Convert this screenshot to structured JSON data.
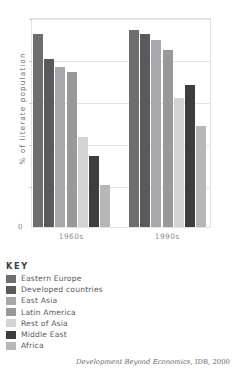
{
  "chart_data": {
    "type": "bar",
    "title": "",
    "xlabel": "",
    "ylabel": "% of literate population",
    "ylim": [
      0,
      100
    ],
    "yticks": [
      0,
      20,
      40,
      60,
      80,
      100
    ],
    "ytick_labels": [
      "0",
      "20",
      "40",
      "60",
      "80",
      "100"
    ],
    "grid": true,
    "legend_position": "below-left",
    "legend_title": "KEY",
    "categories": [
      "1960s",
      "1990s"
    ],
    "series": [
      {
        "name": "Eastern Europe",
        "color": "#6e6e70",
        "values": [
          92,
          94
        ]
      },
      {
        "name": "Developed countries",
        "color": "#5a5a5c",
        "values": [
          80,
          92
        ]
      },
      {
        "name": "East Asia",
        "color": "#a8a8aa",
        "values": [
          76,
          89
        ]
      },
      {
        "name": "Latin America",
        "color": "#999999",
        "values": [
          74,
          84.5
        ]
      },
      {
        "name": "Rest of Asia",
        "color": "#d4d4d4",
        "values": [
          43,
          61.5
        ]
      },
      {
        "name": "Middle East",
        "color": "#3d3d3f",
        "values": [
          34,
          67.5
        ]
      },
      {
        "name": "Africa",
        "color": "#b7b7b9",
        "values": [
          20,
          48
        ]
      }
    ]
  },
  "origin_label": "0",
  "source": {
    "publication": "Development Beyond Economics",
    "attribution": ", IDB, 2000"
  }
}
